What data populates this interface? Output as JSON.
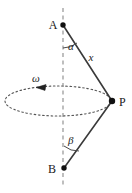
{
  "figure": {
    "type": "physics-diagram",
    "background_color": "#ffffff",
    "stroke_color": "#3a3a3a",
    "label_color": "#1a1a1a",
    "axis": {
      "name": "rotation-axis",
      "style": "dashed",
      "x": 63,
      "y_top": 8,
      "y_bottom": 188
    },
    "points": [
      {
        "id": "A",
        "label": "A",
        "x": 63,
        "y": 25,
        "label_x": 53,
        "label_y": 29,
        "marker": "filled-dot"
      },
      {
        "id": "P",
        "label": "P",
        "x": 112,
        "y": 101,
        "label_x": 119,
        "label_y": 106,
        "marker": "filled-dot"
      },
      {
        "id": "B",
        "label": "B",
        "x": 64,
        "y": 168,
        "label_x": 52,
        "label_y": 173,
        "marker": "filled-dot"
      }
    ],
    "segments": [
      {
        "id": "AP",
        "from": "A",
        "to": "P",
        "style": "solid",
        "length_label": "x"
      },
      {
        "id": "BP",
        "from": "B",
        "to": "P",
        "style": "solid",
        "length_label": ""
      }
    ],
    "length_label": {
      "text": "x",
      "x": 91,
      "y": 61
    },
    "angles": [
      {
        "id": "alpha",
        "symbol": "α",
        "at": "A",
        "between": [
          "axis-down",
          "AP"
        ],
        "label_x": 68,
        "label_y": 50
      },
      {
        "id": "beta",
        "symbol": "β",
        "at": "B",
        "between": [
          "axis-up",
          "BP"
        ],
        "label_x": 68,
        "label_y": 144
      }
    ],
    "circle": {
      "name": "rotation-circle",
      "style": "dotted-ellipse",
      "center_x": 58,
      "center_y": 101,
      "rx": 53,
      "ry": 15
    },
    "angular_velocity": {
      "symbol": "ω",
      "label_x": 36,
      "label_y": 82,
      "arrow_x": 41,
      "arrow_y": 87,
      "direction": "left"
    }
  }
}
